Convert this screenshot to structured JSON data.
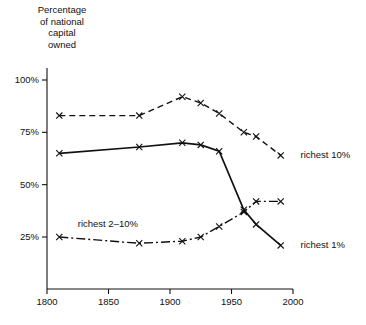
{
  "chart_data": {
    "type": "line",
    "title_lines": [
      "Percentage",
      "of national",
      "capital",
      "owned"
    ],
    "xlabel": "",
    "ylabel": "Percentage of national capital owned",
    "xlim": [
      1800,
      2000
    ],
    "ylim": [
      0,
      100
    ],
    "grid": false,
    "legend_position": "inline-right",
    "xticks": [
      1800,
      1850,
      1900,
      1950,
      2000
    ],
    "xtick_labels": [
      "1800",
      "1850",
      "1900",
      "1950",
      "2000"
    ],
    "yticks": [
      25,
      50,
      75,
      100
    ],
    "ytick_labels": [
      "25%",
      "50%",
      "75%",
      "100%"
    ],
    "series": [
      {
        "name": "richest 10%",
        "label": "richest 10%",
        "style": "dashed",
        "marker": "x",
        "x": [
          1810,
          1875,
          1910,
          1925,
          1940,
          1960,
          1970,
          1990
        ],
        "values": [
          83,
          83,
          92,
          89,
          84,
          75,
          73,
          64
        ]
      },
      {
        "name": "richest 1%",
        "label": "richest 1%",
        "style": "solid",
        "marker": "x",
        "x": [
          1810,
          1875,
          1910,
          1925,
          1940,
          1960,
          1970,
          1990
        ],
        "values": [
          65,
          68,
          70,
          69,
          66,
          38,
          31,
          21
        ]
      },
      {
        "name": "richest 2-10%",
        "label": "richest 2–10%",
        "style": "dashdot",
        "marker": "x",
        "x": [
          1810,
          1875,
          1910,
          1925,
          1940,
          1960,
          1970,
          1990
        ],
        "values": [
          25,
          22,
          23,
          25,
          30,
          37,
          42,
          42
        ]
      }
    ],
    "annotations": [
      {
        "text": "richest 10%",
        "x": 1998,
        "y": 64,
        "anchor": "series-end"
      },
      {
        "text": "richest 1%",
        "x": 1998,
        "y": 21,
        "anchor": "series-end"
      },
      {
        "text": "richest 2–10%",
        "x": 1825,
        "y": 31,
        "anchor": "inline"
      }
    ]
  },
  "caption": {
    "text": ""
  }
}
